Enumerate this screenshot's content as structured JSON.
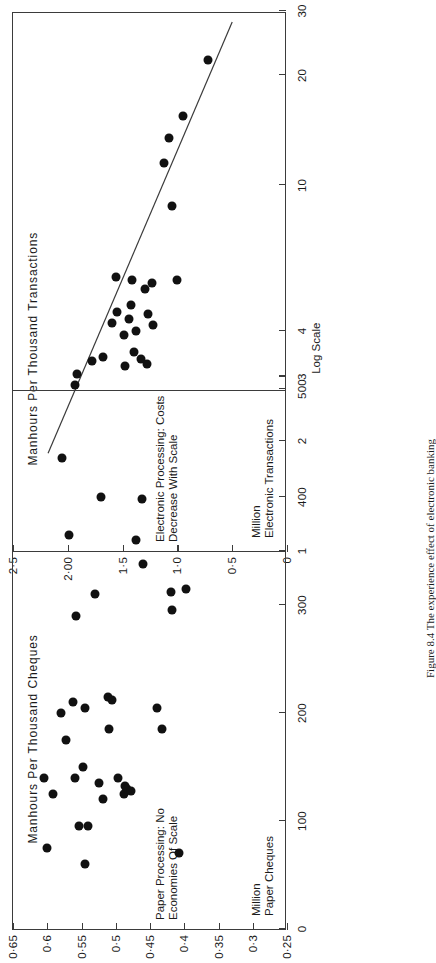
{
  "figure": {
    "caption": "Figure 8.4   The experience effect of electronic banking",
    "orientation_note": "page printed sideways"
  },
  "chart_data": [
    {
      "id": "electronic",
      "type": "scatter",
      "title": "Electronic Processing: Costs\nDecrease With Scale",
      "xlabel": "Million\nElectronic Transactions",
      "xscale_note": "Log Scale",
      "ylabel": "Manhours Per Thousand Transactions",
      "x_is_log": true,
      "xlim": [
        1,
        30
      ],
      "ylim": [
        0,
        2.5
      ],
      "xticks": [
        1,
        2,
        3,
        4,
        10,
        20,
        30
      ],
      "xticklabels": [
        "1",
        "2",
        "3",
        "4",
        "10",
        "20",
        "30"
      ],
      "yticks": [
        0,
        0.5,
        1.0,
        1.5,
        2.0,
        2.5
      ],
      "yticklabels": [
        "0",
        "0·5",
        "1·0",
        "1·5",
        "2·00",
        "2·5"
      ],
      "grid": false,
      "legend": "none",
      "points": [
        {
          "x": 1.8,
          "y": 2.05
        },
        {
          "x": 2.85,
          "y": 1.93
        },
        {
          "x": 3.05,
          "y": 1.92
        },
        {
          "x": 3.3,
          "y": 1.78
        },
        {
          "x": 3.4,
          "y": 1.68
        },
        {
          "x": 4.2,
          "y": 1.6
        },
        {
          "x": 3.2,
          "y": 1.48
        },
        {
          "x": 5.6,
          "y": 1.56
        },
        {
          "x": 4.5,
          "y": 1.55
        },
        {
          "x": 3.9,
          "y": 1.49
        },
        {
          "x": 4.3,
          "y": 1.44
        },
        {
          "x": 3.5,
          "y": 1.4
        },
        {
          "x": 4.0,
          "y": 1.38
        },
        {
          "x": 3.35,
          "y": 1.33
        },
        {
          "x": 4.7,
          "y": 1.42
        },
        {
          "x": 5.5,
          "y": 1.41
        },
        {
          "x": 3.25,
          "y": 1.28
        },
        {
          "x": 4.45,
          "y": 1.27
        },
        {
          "x": 4.15,
          "y": 1.22
        },
        {
          "x": 5.2,
          "y": 1.3
        },
        {
          "x": 5.4,
          "y": 1.23
        },
        {
          "x": 8.8,
          "y": 1.05
        },
        {
          "x": 11.5,
          "y": 1.12
        },
        {
          "x": 5.5,
          "y": 1.0
        },
        {
          "x": 13.5,
          "y": 1.08
        },
        {
          "x": 15.5,
          "y": 0.95
        },
        {
          "x": 22.0,
          "y": 0.72
        }
      ],
      "trendline": {
        "x1": 1.85,
        "y1": 2.18,
        "x2": 28.0,
        "y2": 0.5
      }
    },
    {
      "id": "paper",
      "type": "scatter",
      "title": "Paper Processing: No\nEconomies Of Scale",
      "xlabel": "Million\nPaper Cheques",
      "ylabel": "Manhours Per Thousand Cheques",
      "x_is_log": false,
      "xlim": [
        0,
        500
      ],
      "ylim": [
        0.25,
        0.65
      ],
      "xticks": [
        0,
        100,
        200,
        300,
        400,
        500
      ],
      "xticklabels": [
        "0",
        "100",
        "200",
        "300",
        "400",
        "500"
      ],
      "yticks": [
        0.25,
        0.3,
        0.35,
        0.4,
        0.45,
        0.5,
        0.55,
        0.6,
        0.65
      ],
      "yticklabels": [
        "0·25",
        "0·3",
        "0·35",
        "0·4",
        "0·45",
        "0·5",
        "0·55",
        "0·6",
        "0·65"
      ],
      "grid": false,
      "legend": "none",
      "points": [
        {
          "x": 75,
          "y": 0.6
        },
        {
          "x": 140,
          "y": 0.605
        },
        {
          "x": 125,
          "y": 0.592
        },
        {
          "x": 200,
          "y": 0.58
        },
        {
          "x": 175,
          "y": 0.572
        },
        {
          "x": 210,
          "y": 0.562
        },
        {
          "x": 290,
          "y": 0.558
        },
        {
          "x": 365,
          "y": 0.568
        },
        {
          "x": 95,
          "y": 0.553
        },
        {
          "x": 140,
          "y": 0.56
        },
        {
          "x": 60,
          "y": 0.545
        },
        {
          "x": 95,
          "y": 0.54
        },
        {
          "x": 150,
          "y": 0.548
        },
        {
          "x": 205,
          "y": 0.545
        },
        {
          "x": 310,
          "y": 0.53
        },
        {
          "x": 135,
          "y": 0.524
        },
        {
          "x": 120,
          "y": 0.518
        },
        {
          "x": 400,
          "y": 0.522
        },
        {
          "x": 185,
          "y": 0.51
        },
        {
          "x": 215,
          "y": 0.512
        },
        {
          "x": 212,
          "y": 0.505
        },
        {
          "x": 140,
          "y": 0.496
        },
        {
          "x": 125,
          "y": 0.488
        },
        {
          "x": 132,
          "y": 0.486
        },
        {
          "x": 130,
          "y": 0.484
        },
        {
          "x": 128,
          "y": 0.478
        },
        {
          "x": 360,
          "y": 0.47
        },
        {
          "x": 338,
          "y": 0.46
        },
        {
          "x": 398,
          "y": 0.462
        },
        {
          "x": 205,
          "y": 0.44
        },
        {
          "x": 185,
          "y": 0.432
        },
        {
          "x": 295,
          "y": 0.418
        },
        {
          "x": 312,
          "y": 0.42
        },
        {
          "x": 70,
          "y": 0.408
        },
        {
          "x": 315,
          "y": 0.398
        }
      ]
    }
  ]
}
